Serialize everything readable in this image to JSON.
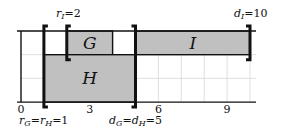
{
  "diagram": {
    "type": "interval-schedule",
    "axis": {
      "min": 0,
      "max": 10,
      "ticks": [
        0,
        3,
        6,
        9
      ],
      "tick_labels": [
        "0",
        "3",
        "6",
        "9"
      ]
    },
    "rows": 3,
    "intervals": [
      {
        "name": "G",
        "start": 2,
        "end": 4,
        "row": 0,
        "fill": "#c0c0c0",
        "label": "G"
      },
      {
        "name": "I",
        "start": 5,
        "end": 10,
        "row": 0,
        "fill": "#c0c0c0",
        "label": "I"
      },
      {
        "name": "H",
        "start": 1,
        "end": 5,
        "row_start": 1,
        "row_end": 2,
        "fill": "#c0c0c0",
        "label": "H"
      }
    ],
    "brackets": [
      {
        "at": 1,
        "side": "left",
        "span": "full"
      },
      {
        "at": 2,
        "side": "left",
        "span": "top"
      },
      {
        "at": 5,
        "side": "right",
        "span": "full"
      },
      {
        "at": 10,
        "side": "right",
        "span": "top"
      }
    ],
    "annotations": {
      "r_I": "r_I=2",
      "d_I": "d_I=10",
      "r_GH": "r_G=r_H=1",
      "d_GH": "d_G=d_H=5"
    }
  }
}
